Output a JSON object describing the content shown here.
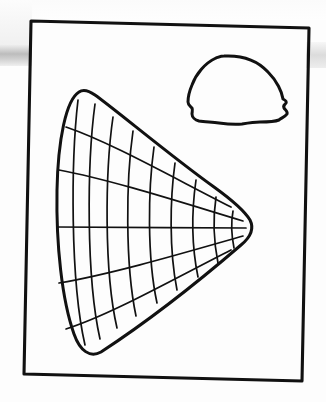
{
  "page": {
    "title": "Line drawing plate",
    "background_color": "#ffffff",
    "ink_color": "#111111",
    "width": 326,
    "height": 402
  },
  "frame": {
    "name": "rectangular border",
    "stroke_color": "#111111",
    "stroke_width": 3,
    "corners": [
      [
        31,
        21
      ],
      [
        309,
        28
      ],
      [
        302,
        381
      ],
      [
        24,
        374
      ]
    ]
  },
  "figures": [
    {
      "id": "fan-grid",
      "label": "gridded wedge",
      "description": "Large leaf or fan shaped outline filled with a curvilinear grid of radial lines converging to the rounded right tip and arcs spanning top to bottom",
      "radial_line_count": 5,
      "arc_line_count": 9,
      "tip_position": [
        248,
        228
      ],
      "outline_path": "M 79 92 C 66 100 58 140 57 190 C 56 245 62 300 74 334 C 80 351 90 358 101 352 C 150 320 205 276 241 245 C 252 236 254 228 250 220 C 244 210 232 200 214 187 C 172 157 116 110 95 95 C 88 90 83 89 79 92 Z",
      "radial_paths": [
        "M 66 127 C 110 142 170 176 231 207",
        "M 59 170 C 112 180 180 202 243 221",
        "M 57 227 C 115 227 185 228 246 228",
        "M 59 283 C 112 274 180 254 243 236",
        "M 66 329 C 110 315 170 281 231 250"
      ],
      "arc_paths": [
        "M 78 100 C 71 160 70 280 85 345",
        "M 95 104 C 87 163 86 277 100 339",
        "M 113 117 C 105 172 104 272 117 328",
        "M 133 131 C 126 180 125 264 136 316",
        "M 154 147 C 148 190 147 257 157 303",
        "M 175 163 C 170 199 169 250 177 290",
        "M 196 180 C 192 208 191 243 198 277",
        "M 216 197 C 213 217 213 238 218 263",
        "M 233 211 C 231 222 231 233 234 248"
      ]
    },
    {
      "id": "dome-cap",
      "label": "dome shaped cap outline",
      "description": "Smaller rounded dome or mushroom cap outline with an irregular wavy base and small notches on the lower sides",
      "outline_path": "M 224 56 C 243 55 258 61 268 72 C 277 81 282 92 283 99 C 285 100 287 101 286 103 C 284 105 283 106 284 108 C 285 110 288 111 287 114 C 285 117 281 118 279 120 C 274 122 266 122 260 122 C 254 122 248 123 242 124 C 234 125 226 124 219 123 C 212 122 205 122 199 121 C 195 120 192 117 192 114 C 192 112 193 110 192 108 C 190 106 188 105 188 102 C 188 98 189 92 192 85 C 196 74 205 63 216 58 C 219 57 221 56 224 56 Z"
    }
  ]
}
